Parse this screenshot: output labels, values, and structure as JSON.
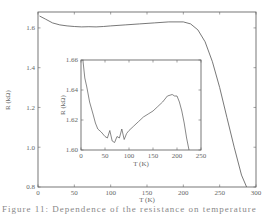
{
  "chart_data": [
    {
      "id": "main",
      "type": "line",
      "title": "",
      "xlabel": "T (K)",
      "ylabel": "R (kΩ)",
      "xlim": [
        0,
        300
      ],
      "ylim": [
        0.8,
        1.68
      ],
      "xticks": [
        0,
        50,
        100,
        150,
        200,
        250,
        300
      ],
      "yticks": [
        0.8,
        1.0,
        1.2,
        1.4,
        1.6
      ],
      "grid": false,
      "series": [
        {
          "name": "R(T)",
          "x": [
            2,
            10,
            20,
            30,
            40,
            50,
            60,
            70,
            80,
            90,
            100,
            120,
            140,
            160,
            180,
            200,
            210,
            220,
            230,
            240,
            250,
            260,
            270,
            280,
            287
          ],
          "y": [
            1.66,
            1.645,
            1.625,
            1.615,
            1.61,
            1.607,
            1.605,
            1.606,
            1.605,
            1.607,
            1.61,
            1.615,
            1.62,
            1.625,
            1.63,
            1.63,
            1.62,
            1.59,
            1.53,
            1.43,
            1.3,
            1.15,
            1.0,
            0.86,
            0.8
          ]
        }
      ]
    },
    {
      "id": "inset",
      "type": "line",
      "title": "",
      "xlabel": "T (K)",
      "ylabel": "R (kΩ)",
      "xlim": [
        0,
        250
      ],
      "ylim": [
        1.6,
        1.66
      ],
      "xticks": [
        0,
        50,
        100,
        150,
        200,
        250
      ],
      "yticks": [
        1.6,
        1.62,
        1.64,
        1.66
      ],
      "grid": false,
      "series": [
        {
          "name": "R(T) low-T detail",
          "x": [
            4,
            8,
            12,
            18,
            25,
            30,
            35,
            42,
            50,
            55,
            60,
            65,
            70,
            75,
            80,
            85,
            90,
            95,
            100,
            110,
            120,
            130,
            140,
            150,
            160,
            170,
            180,
            190,
            195,
            200,
            205,
            210,
            215,
            220,
            225
          ],
          "y": [
            1.66,
            1.648,
            1.642,
            1.632,
            1.624,
            1.618,
            1.614,
            1.612,
            1.609,
            1.608,
            1.613,
            1.606,
            1.605,
            1.609,
            1.608,
            1.614,
            1.607,
            1.611,
            1.613,
            1.616,
            1.619,
            1.622,
            1.624,
            1.626,
            1.629,
            1.632,
            1.636,
            1.637,
            1.636,
            1.636,
            1.632,
            1.626,
            1.618,
            1.608,
            1.6
          ]
        }
      ]
    }
  ],
  "caption": "Figure 11: Dependence of the resistance on temperature"
}
